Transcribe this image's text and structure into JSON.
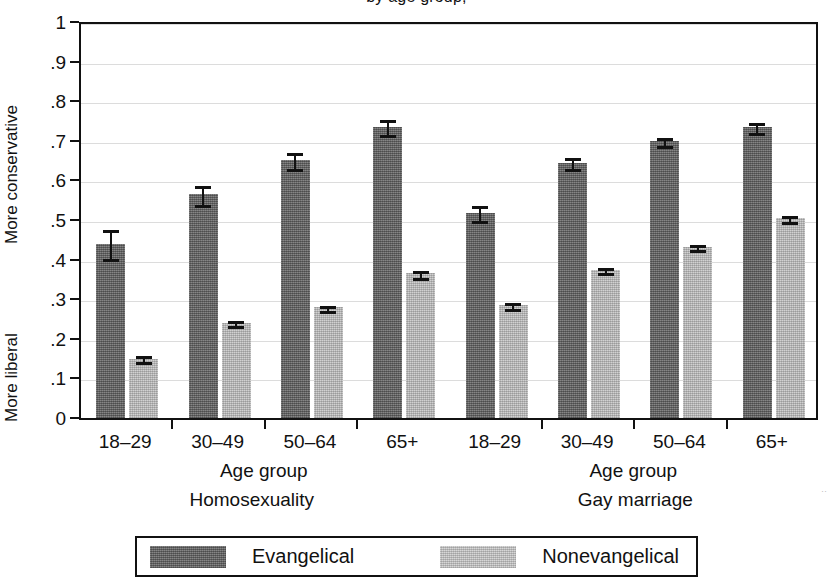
{
  "figure": {
    "title_partial": "by age group,",
    "y_axis_top_label": "More conservative",
    "y_axis_bottom_label": "More liberal",
    "y_tick_labels": [
      "1",
      ".9",
      ".8",
      ".7",
      ".6",
      ".5",
      ".4",
      ".3",
      ".2",
      ".1",
      "0"
    ],
    "panel_axis_label": "Age group",
    "panels": [
      "Homosexuality",
      "Gay marriage"
    ],
    "edge_artifact": "··"
  },
  "legend": {
    "position": "bottom-center",
    "entries": [
      {
        "label": "Evangelical",
        "color": "#6f6f6f",
        "swatch": "dark-gray-dither"
      },
      {
        "label": "Nonevangelical",
        "color": "#c2c2c2",
        "swatch": "light-gray-dither"
      }
    ]
  },
  "chart_data": {
    "type": "bar",
    "title": "by age group,",
    "xlabel": "Age group",
    "ylabel": "More conservative / More liberal",
    "ylim": [
      0,
      1
    ],
    "yticks": [
      0,
      0.1,
      0.2,
      0.3,
      0.4,
      0.5,
      0.6,
      0.7,
      0.8,
      0.9,
      1
    ],
    "ytick_labels": [
      "0",
      ".1",
      ".2",
      ".3",
      ".4",
      ".5",
      ".6",
      ".7",
      ".8",
      ".9",
      "1"
    ],
    "grid": true,
    "grid_axis": "y",
    "legend": [
      "Evangelical",
      "Nonevangelical"
    ],
    "legend_position": "bottom",
    "error_bars": "95% confidence interval",
    "panels": [
      {
        "name": "Homosexuality",
        "categories": [
          "18–29",
          "30–49",
          "50–64",
          "65+"
        ],
        "series": [
          {
            "name": "Evangelical",
            "color": "#6f6f6f",
            "values": [
              0.44,
              0.565,
              0.652,
              0.735
            ],
            "err_low": [
              0.402,
              0.539,
              0.63,
              0.714
            ],
            "err_high": [
              0.479,
              0.591,
              0.674,
              0.757
            ]
          },
          {
            "name": "Nonevangelical",
            "color": "#b9b9b9",
            "values": [
              0.15,
              0.24,
              0.28,
              0.365
            ],
            "err_low": [
              0.141,
              0.232,
              0.271,
              0.354
            ],
            "err_high": [
              0.161,
              0.249,
              0.289,
              0.376
            ]
          }
        ]
      },
      {
        "name": "Gay marriage",
        "categories": [
          "18–29",
          "30–49",
          "50–64",
          "65+"
        ],
        "series": [
          {
            "name": "Evangelical",
            "color": "#6f6f6f",
            "values": [
              0.518,
              0.645,
              0.7,
              0.735
            ],
            "err_low": [
              0.497,
              0.628,
              0.687,
              0.72
            ],
            "err_high": [
              0.541,
              0.661,
              0.713,
              0.75
            ]
          },
          {
            "name": "Nonevangelical",
            "color": "#b9b9b9",
            "values": [
              0.285,
              0.375,
              0.432,
              0.505
            ],
            "err_low": [
              0.275,
              0.366,
              0.423,
              0.496
            ],
            "err_high": [
              0.296,
              0.384,
              0.441,
              0.514
            ]
          }
        ]
      }
    ]
  }
}
